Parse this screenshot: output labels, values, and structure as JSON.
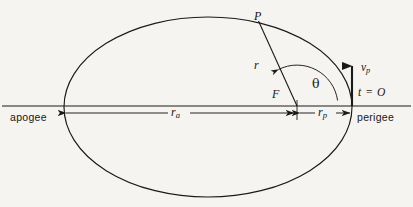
{
  "figure": {
    "type": "orbital-ellipse-diagram",
    "background_color": "#f6f4f0",
    "stroke_color": "#1a1a1a"
  },
  "labels": {
    "apogee": "apogee",
    "perigee": "perigee",
    "point_P": "P",
    "focus_F": "F",
    "radius_r": "r",
    "true_anomaly": "θ",
    "perigee_velocity_symbol": "v",
    "perigee_velocity_subscript": "p",
    "time_zero": "t = O",
    "apoapsis_distance_symbol": "r",
    "apoapsis_distance_subscript": "a",
    "periapsis_distance_symbol": "r",
    "periapsis_distance_subscript": "p"
  },
  "geometry": {
    "ellipse": {
      "cx": 208,
      "cy": 107,
      "rx": 144,
      "ry": 90
    },
    "major_axis_line": {
      "x1": 2,
      "y1": 106,
      "x2": 411,
      "y2": 106
    },
    "focus": {
      "x": 297,
      "y": 106
    },
    "point_P": {
      "x": 258,
      "y": 21
    },
    "perigee_point": {
      "x": 352,
      "y": 106
    },
    "apogee_point": {
      "x": 64,
      "y": 106
    },
    "dimension_line_y": 113,
    "ra_extent": {
      "from": 65,
      "to": 295
    },
    "rp_extent": {
      "from": 299,
      "to": 351
    },
    "velocity_arrow": {
      "x": 352,
      "y_tail": 106,
      "y_head": 62
    },
    "theta_arc": {
      "center_x": 297,
      "center_y": 106,
      "radius": 41
    }
  }
}
